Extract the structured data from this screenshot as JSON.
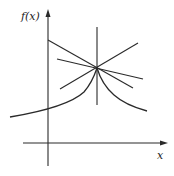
{
  "figure": {
    "y_axis_label": "f(x)",
    "x_axis_label": "x",
    "stroke_color": "#2a2a2a",
    "background": "#ffffff"
  },
  "geometry": {
    "origin": [
      48,
      143
    ],
    "cusp_point": [
      97,
      68
    ],
    "y_axis": {
      "x": 48,
      "top": 11,
      "bottom": 166
    },
    "x_axis": {
      "y": 143,
      "left": 23,
      "right": 166
    },
    "vertical_line": {
      "x": 97,
      "top": 27,
      "bottom": 105
    },
    "lines": [
      {
        "from": [
          48,
          40
        ],
        "to": [
          133,
          88
        ]
      },
      {
        "from": [
          57,
          59
        ],
        "to": [
          143,
          79
        ]
      },
      {
        "from": [
          60,
          89
        ],
        "to": [
          138,
          43
        ]
      }
    ],
    "curve_left": {
      "from": [
        10,
        117
      ],
      "to": [
        97,
        68
      ]
    },
    "curve_right": {
      "from": [
        97,
        68
      ],
      "to": [
        147,
        111
      ]
    }
  }
}
